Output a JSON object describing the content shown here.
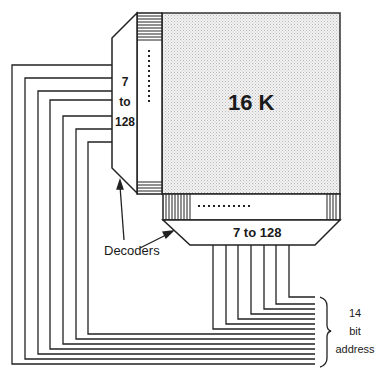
{
  "diagram": {
    "memory_block": {
      "label": "16 K",
      "fill": "#e8e8e8"
    },
    "row_decoder": {
      "label_lines": [
        "7",
        "to",
        "128"
      ]
    },
    "column_decoder": {
      "label": "7 to 128"
    },
    "decoders_label": "Decoders",
    "address_label": {
      "lines": [
        "14",
        "bit",
        "address"
      ]
    },
    "address_bits": 14,
    "row_address_lines": 7,
    "column_address_lines": 7,
    "line_color": "#222222"
  }
}
